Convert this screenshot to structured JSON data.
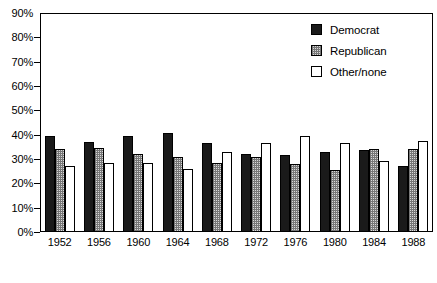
{
  "chart_data": {
    "type": "bar",
    "title": "",
    "subtitle": "",
    "xlabel": "",
    "ylabel": "",
    "categories": [
      "1952",
      "1956",
      "1960",
      "1964",
      "1968",
      "1972",
      "1976",
      "1980",
      "1984",
      "1988"
    ],
    "series": [
      {
        "name": "Democrat",
        "color": "#1a1a1a",
        "fill": "solid-black",
        "values": [
          39.5,
          37.0,
          39.5,
          40.5,
          36.5,
          32.0,
          31.5,
          33.0,
          33.5,
          27.0
        ]
      },
      {
        "name": "Republican",
        "color": "#d9d9d9",
        "fill": "checkered-gray",
        "values": [
          34.0,
          34.5,
          32.0,
          31.0,
          28.5,
          31.0,
          28.0,
          25.5,
          34.0,
          34.0
        ]
      },
      {
        "name": "Other/none",
        "color": "#ffffff",
        "fill": "white",
        "values": [
          27.0,
          28.5,
          28.5,
          26.0,
          33.0,
          36.5,
          39.5,
          36.5,
          29.0,
          37.5
        ]
      }
    ],
    "ylim": [
      0,
      90
    ],
    "y_ticks": [
      0,
      10,
      20,
      30,
      40,
      50,
      60,
      70,
      80,
      90
    ],
    "y_tick_labels": [
      "0%",
      "10%",
      "20%",
      "30%",
      "40%",
      "50%",
      "60%",
      "70%",
      "80%",
      "90%"
    ],
    "grid": false,
    "legend_position": "top-right"
  },
  "legend": {
    "entries": [
      {
        "label": "Democrat"
      },
      {
        "label": "Republican"
      },
      {
        "label": "Other/none"
      }
    ]
  }
}
